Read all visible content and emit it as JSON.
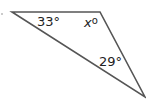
{
  "diagram": {
    "type": "triangle",
    "vertices": {
      "top_left": [
        12,
        12
      ],
      "top_right": [
        100,
        12
      ],
      "bottom_right": [
        145,
        97
      ]
    },
    "angles": [
      {
        "vertex": "top_left",
        "label": "33°",
        "value": 33
      },
      {
        "vertex": "top_right",
        "label": "x°",
        "variable": "x"
      },
      {
        "vertex": "bottom_right",
        "label": "29°",
        "value": 29
      }
    ],
    "stroke_color": "#555555"
  }
}
